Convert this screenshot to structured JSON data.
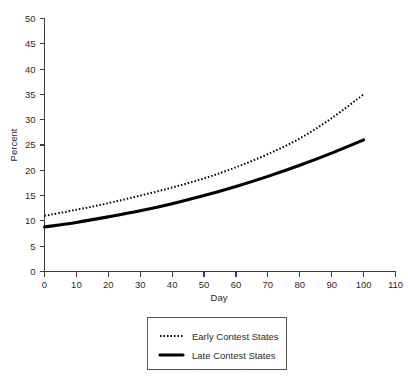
{
  "chart_data": {
    "type": "line",
    "title": "",
    "xlabel": "Day",
    "ylabel": "Percent",
    "xlim": [
      0,
      110
    ],
    "ylim": [
      0,
      50
    ],
    "xticks": [
      0,
      10,
      20,
      30,
      40,
      50,
      60,
      70,
      80,
      90,
      100,
      110
    ],
    "yticks": [
      0,
      5,
      10,
      15,
      20,
      25,
      30,
      35,
      40,
      45,
      50
    ],
    "grid": false,
    "legend_position": "below-plot",
    "x": [
      0,
      10,
      20,
      30,
      40,
      50,
      60,
      70,
      80,
      90,
      100
    ],
    "series": [
      {
        "name": "Early Contest States",
        "style": "dotted",
        "color": "#000000",
        "values": [
          11.0,
          12.2,
          13.5,
          15.0,
          16.6,
          18.4,
          20.6,
          23.2,
          26.3,
          30.3,
          35.0
        ]
      },
      {
        "name": "Late Contest States",
        "style": "solid",
        "color": "#000000",
        "values": [
          8.8,
          9.7,
          10.8,
          12.0,
          13.4,
          15.0,
          16.8,
          18.8,
          21.0,
          23.4,
          26.0
        ]
      }
    ]
  },
  "axes": {
    "y_title": "Percent",
    "x_title": "Day",
    "x_tick_labels": [
      "0",
      "10",
      "20",
      "30",
      "40",
      "50",
      "60",
      "70",
      "80",
      "90",
      "100",
      "110"
    ],
    "y_tick_labels": [
      "0",
      "5",
      "10",
      "15",
      "20",
      "25",
      "30",
      "35",
      "40",
      "45",
      "50"
    ]
  },
  "legend": {
    "entries": [
      {
        "label": "Early Contest States",
        "style": "dotted"
      },
      {
        "label": "Late Contest States",
        "style": "solid"
      }
    ]
  }
}
